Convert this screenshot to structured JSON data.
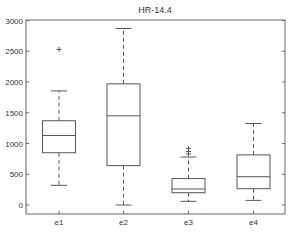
{
  "chart_data": {
    "type": "boxplot",
    "title": "HR-14.4",
    "xlabel": "",
    "ylabel": "",
    "categories": [
      "e1",
      "e2",
      "e3",
      "e4"
    ],
    "ylim": [
      -50,
      3000
    ],
    "yticks": [
      0,
      500,
      1000,
      1500,
      2000,
      2500,
      3000
    ],
    "grid": false,
    "legend": null,
    "series": [
      {
        "name": "e1",
        "whisker_low": 320,
        "q1": 850,
        "median": 1130,
        "q3": 1370,
        "whisker_high": 1855,
        "outliers": [
          2530
        ]
      },
      {
        "name": "e2",
        "whisker_low": 0,
        "q1": 640,
        "median": 1450,
        "q3": 1970,
        "whisker_high": 2870,
        "outliers": []
      },
      {
        "name": "e3",
        "whisker_low": 60,
        "q1": 200,
        "median": 260,
        "q3": 430,
        "whisker_high": 780,
        "outliers": [
          830,
          870,
          920
        ]
      },
      {
        "name": "e4",
        "whisker_low": 75,
        "q1": 265,
        "median": 460,
        "q3": 815,
        "whisker_high": 1325,
        "outliers": []
      }
    ]
  },
  "style": {
    "line_color": "#555555",
    "frame_color": "#666666",
    "text_color": "#333333"
  }
}
